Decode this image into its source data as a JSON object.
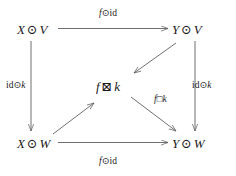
{
  "diagram": {
    "type": "commutative-diagram",
    "background_color": "#ffffff",
    "stroke_color": "#5f5f5f",
    "text_color": "#1a1a1a",
    "nodes": [
      {
        "id": "top-left",
        "label": "X ⊙ V",
        "var1": "X",
        "op": "⊙",
        "var2": "V",
        "x": 17,
        "y": 22
      },
      {
        "id": "top-right",
        "label": "Y ⊙ V",
        "var1": "Y",
        "op": "⊙",
        "var2": "V",
        "x": 172,
        "y": 22
      },
      {
        "id": "center",
        "label": "f ⊠ k",
        "var1": "f",
        "op": "⊠",
        "var2": "k",
        "x": 96,
        "y": 79
      },
      {
        "id": "bottom-left",
        "label": "X ⊙ W",
        "var1": "X",
        "op": "⊙",
        "var2": "W",
        "x": 17,
        "y": 136
      },
      {
        "id": "bottom-right",
        "label": "Y ⊙ W",
        "var1": "Y",
        "op": "⊙",
        "var2": "W",
        "x": 172,
        "y": 136
      }
    ],
    "edges": [
      {
        "id": "top",
        "from": "top-left",
        "to": "top-right",
        "label": "f⊙id",
        "label_var": "f",
        "label_op": "⊙",
        "label_rm": "id",
        "direction": "right"
      },
      {
        "id": "bottom",
        "from": "bottom-left",
        "to": "bottom-right",
        "label": "f⊙id",
        "label_var": "f",
        "label_op": "⊙",
        "label_rm": "id",
        "direction": "right"
      },
      {
        "id": "left",
        "from": "top-left",
        "to": "bottom-left",
        "label": "id⊙k",
        "label_rm": "id",
        "label_op": "⊙",
        "label_var": "k",
        "direction": "down"
      },
      {
        "id": "right",
        "from": "top-right",
        "to": "bottom-right",
        "label": "id⊙k",
        "label_rm": "id",
        "label_op": "⊙",
        "label_var": "k",
        "direction": "down"
      },
      {
        "id": "diag-tr-center",
        "from": "top-right",
        "to": "center",
        "label": "",
        "direction": "down-left"
      },
      {
        "id": "diag-bl-center",
        "from": "bottom-left",
        "to": "center",
        "label": "",
        "direction": "up-right"
      },
      {
        "id": "diag-center-br",
        "from": "center",
        "to": "bottom-right",
        "label": "f□k",
        "label_var": "f",
        "label_op": "□",
        "label_var2": "k",
        "direction": "down-right"
      }
    ]
  },
  "labels": {
    "node_xv_v1": "X",
    "node_xv_op": "⊙",
    "node_xv_v2": "V",
    "node_yv_v1": "Y",
    "node_yv_op": "⊙",
    "node_yv_v2": "V",
    "node_fk_v1": "f",
    "node_fk_op": "⊠",
    "node_fk_v2": "k",
    "node_xw_v1": "X",
    "node_xw_op": "⊙",
    "node_xw_v2": "W",
    "node_yw_v1": "Y",
    "node_yw_op": "⊙",
    "node_yw_v2": "W",
    "top_f": "f",
    "top_op": "⊙",
    "top_id": "id",
    "bottom_f": "f",
    "bottom_op": "⊙",
    "bottom_id": "id",
    "left_id": "id",
    "left_op": "⊙",
    "left_k": "k",
    "right_id": "id",
    "right_op": "⊙",
    "right_k": "k",
    "fboxk_f": "f",
    "fboxk_op": "□",
    "fboxk_k": "k"
  }
}
